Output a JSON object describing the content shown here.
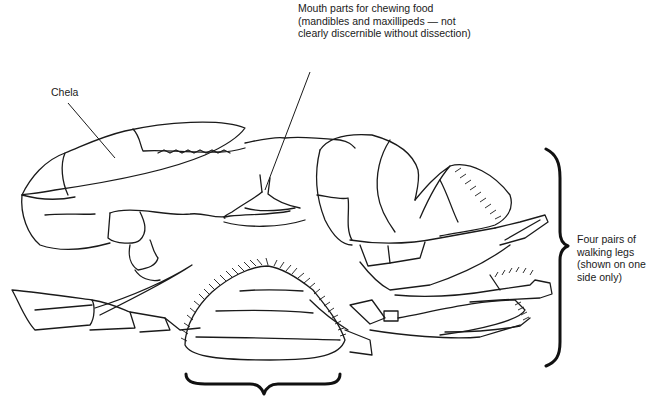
{
  "diagram": {
    "labels": {
      "mouth_parts": "Mouth parts for chewing food (mandibles and maxillipeds — not clearly discernible without dissection)",
      "chela": "Chela",
      "walking_legs": "Four pairs of walking legs (shown on one side only)"
    },
    "annotations": [
      {
        "id": "mouth_parts",
        "type": "leader-line",
        "target": "mouth parts"
      },
      {
        "id": "chela",
        "type": "leader-line",
        "target": "chela (claw)"
      },
      {
        "id": "walking_legs",
        "type": "curly-brace-vertical",
        "target": "walking legs"
      },
      {
        "id": "abdomen",
        "type": "curly-brace-horizontal",
        "target": "abdominal flap",
        "label": ""
      }
    ],
    "colors": {
      "ink": "#1a1a1a",
      "background": "#ffffff"
    }
  }
}
